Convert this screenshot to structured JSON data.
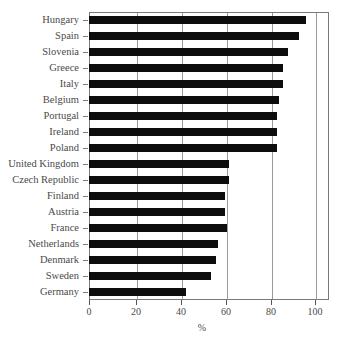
{
  "chart_data": {
    "type": "bar",
    "orientation": "horizontal",
    "title": "",
    "xlabel": "%",
    "ylabel": "",
    "xlim": [
      0,
      100
    ],
    "xticks": [
      0,
      20,
      40,
      60,
      80,
      100
    ],
    "grid": true,
    "legend": false,
    "bar_color": "#0d0d0d",
    "categories": [
      "Hungary",
      "Spain",
      "Slovenia",
      "Greece",
      "Italy",
      "Belgium",
      "Portugal",
      "Ireland",
      "Poland",
      "United Kingdom",
      "Czech Republic",
      "Finland",
      "Austria",
      "France",
      "Netherlands",
      "Denmark",
      "Sweden",
      "Germany"
    ],
    "values": [
      96,
      93,
      88,
      86,
      86,
      84,
      83,
      83,
      83,
      62,
      62,
      60,
      60,
      61,
      57,
      56,
      54,
      43
    ]
  },
  "axis": {
    "x_title": "%",
    "tick_labels": [
      "0",
      "20",
      "40",
      "60",
      "80",
      "100"
    ]
  },
  "labels": {
    "c0": "Hungary",
    "c1": "Spain",
    "c2": "Slovenia",
    "c3": "Greece",
    "c4": "Italy",
    "c5": "Belgium",
    "c6": "Portugal",
    "c7": "Ireland",
    "c8": "Poland",
    "c9": "United Kingdom",
    "c10": "Czech Republic",
    "c11": "Finland",
    "c12": "Austria",
    "c13": "France",
    "c14": "Netherlands",
    "c15": "Denmark",
    "c16": "Sweden",
    "c17": "Germany"
  }
}
